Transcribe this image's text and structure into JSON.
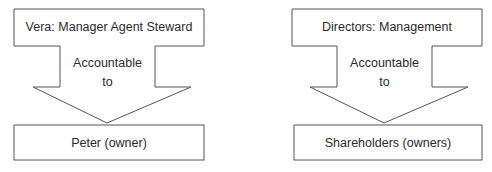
{
  "diagram": {
    "panels": [
      {
        "top_label": "Vera: Manager Agent Steward",
        "arrow_label_line1": "Accountable",
        "arrow_label_line2": "to",
        "bottom_label": "Peter (owner)"
      },
      {
        "top_label": "Directors: Management",
        "arrow_label_line1": "Accountable",
        "arrow_label_line2": "to",
        "bottom_label": "Shareholders (owners)"
      }
    ],
    "stroke_color": "#555555",
    "text_color": "#2a2a2a"
  }
}
